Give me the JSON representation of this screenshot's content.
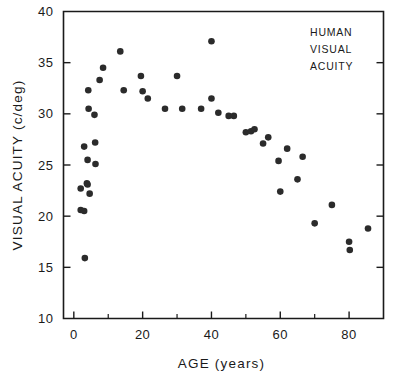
{
  "chart_data": {
    "type": "scatter",
    "title": "",
    "annotation_lines": [
      "HUMAN",
      "VISUAL",
      "ACUITY"
    ],
    "xlabel": "AGE (years)",
    "ylabel": "VISUAL ACUITY (c/deg)",
    "xlim": [
      -3,
      90
    ],
    "ylim": [
      10,
      40
    ],
    "xticks": [
      0,
      20,
      40,
      60,
      80
    ],
    "xtick_labels": [
      "0",
      "20",
      "40",
      "60",
      "80"
    ],
    "xminorticks": [
      10,
      30,
      50,
      70
    ],
    "yticks": [
      10,
      15,
      20,
      25,
      30,
      35,
      40
    ],
    "ytick_labels": [
      "10",
      "15",
      "20",
      "25",
      "30",
      "35",
      "40"
    ],
    "grid": false,
    "legend_position": "top-right",
    "marker": "filled-circle",
    "marker_color": "#2b2b2b",
    "points": [
      {
        "x": 2.0,
        "y": 22.7
      },
      {
        "x": 2.0,
        "y": 20.6
      },
      {
        "x": 3.0,
        "y": 26.8
      },
      {
        "x": 3.0,
        "y": 20.5
      },
      {
        "x": 3.2,
        "y": 15.9
      },
      {
        "x": 3.8,
        "y": 23.2
      },
      {
        "x": 4.0,
        "y": 23.1
      },
      {
        "x": 4.0,
        "y": 25.5
      },
      {
        "x": 4.2,
        "y": 32.3
      },
      {
        "x": 4.3,
        "y": 30.5
      },
      {
        "x": 4.6,
        "y": 22.2
      },
      {
        "x": 6.0,
        "y": 29.9
      },
      {
        "x": 6.2,
        "y": 27.2
      },
      {
        "x": 6.3,
        "y": 25.1
      },
      {
        "x": 7.5,
        "y": 33.3
      },
      {
        "x": 8.5,
        "y": 34.5
      },
      {
        "x": 13.5,
        "y": 36.1
      },
      {
        "x": 14.5,
        "y": 32.3
      },
      {
        "x": 19.5,
        "y": 33.7
      },
      {
        "x": 20.0,
        "y": 32.2
      },
      {
        "x": 21.5,
        "y": 31.5
      },
      {
        "x": 26.5,
        "y": 30.5
      },
      {
        "x": 30.0,
        "y": 33.7
      },
      {
        "x": 31.5,
        "y": 30.5
      },
      {
        "x": 37.0,
        "y": 30.5
      },
      {
        "x": 40.0,
        "y": 37.1
      },
      {
        "x": 40.0,
        "y": 31.5
      },
      {
        "x": 42.0,
        "y": 30.1
      },
      {
        "x": 45.0,
        "y": 29.8
      },
      {
        "x": 46.5,
        "y": 29.8
      },
      {
        "x": 50.0,
        "y": 28.2
      },
      {
        "x": 51.5,
        "y": 28.3
      },
      {
        "x": 52.5,
        "y": 28.5
      },
      {
        "x": 55.0,
        "y": 27.1
      },
      {
        "x": 56.5,
        "y": 27.7
      },
      {
        "x": 59.5,
        "y": 25.4
      },
      {
        "x": 60.0,
        "y": 22.4
      },
      {
        "x": 62.0,
        "y": 26.6
      },
      {
        "x": 65.0,
        "y": 23.6
      },
      {
        "x": 66.5,
        "y": 25.8
      },
      {
        "x": 70.0,
        "y": 19.3
      },
      {
        "x": 75.0,
        "y": 21.1
      },
      {
        "x": 80.0,
        "y": 17.5
      },
      {
        "x": 80.2,
        "y": 16.7
      },
      {
        "x": 85.5,
        "y": 18.8
      }
    ]
  }
}
